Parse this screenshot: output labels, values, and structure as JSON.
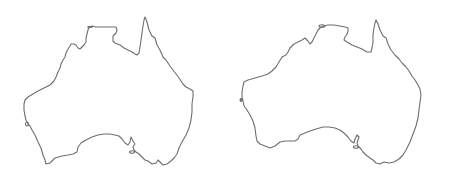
{
  "scene": {
    "description": "Two hand-traced outline drawings of the Australian continent shown side by side on a white background",
    "background_color": "#ffffff",
    "stroke_color": "#6e6e6e"
  },
  "maps": [
    {
      "label": "australia-outline-left",
      "region": "Australia",
      "position": "left"
    },
    {
      "label": "australia-outline-right",
      "region": "Australia",
      "position": "right"
    }
  ]
}
